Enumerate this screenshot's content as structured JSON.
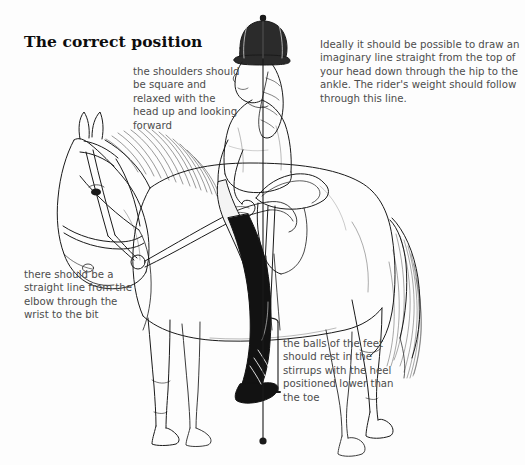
{
  "page": {
    "title": "The correct position",
    "background_color": "#fdfdfd",
    "ink_color": "#1a1a1a",
    "text_color": "#4c4c4c"
  },
  "annotations": [
    {
      "id": "shoulders",
      "text": "the shoulders should be square and relaxed with the head up and looking forward"
    },
    {
      "id": "plumb-line",
      "text": "Ideally it should be possible to draw an imaginary line straight from the top of your head down through the hip to the ankle. The rider's weight should follow through this line."
    },
    {
      "id": "elbow",
      "text": "there should be a straight line from the elbow through the wrist to the bit"
    },
    {
      "id": "feet",
      "text": "the balls of the feet should rest in the stirrups with the heel positioned lower than the toe"
    }
  ],
  "illustration": {
    "subject": "horse-and-rider-side-view",
    "plumb_line": {
      "label": "vertical-plumb-line",
      "x": 263,
      "top_y": 18,
      "bottom_y": 441,
      "color": "#1a1a1a"
    },
    "parts": [
      "horse-head",
      "horse-bridle",
      "horse-reins",
      "horse-mane",
      "horse-neck",
      "horse-body",
      "horse-tail",
      "horse-foreleg",
      "horse-hindleg",
      "saddle",
      "stirrup",
      "rider-helmet",
      "rider-braid",
      "rider-torso",
      "rider-arm",
      "rider-breeches",
      "rider-boot"
    ]
  }
}
